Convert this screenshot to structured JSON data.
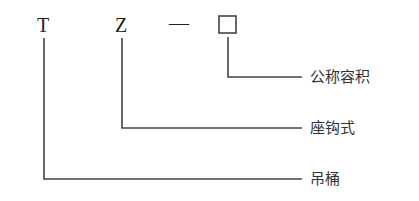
{
  "diagram": {
    "code_letters": {
      "first": "T",
      "second": "Z",
      "separator": "—"
    },
    "box": "□",
    "labels": {
      "box_label": "公称容积",
      "second_label": "座钩式",
      "first_label": "吊桶"
    },
    "line_color": "#444444"
  }
}
